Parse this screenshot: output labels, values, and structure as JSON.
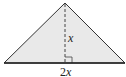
{
  "figure": {
    "shape": "isosceles triangle",
    "fill_color": "#e9e9e9",
    "stroke_color": "#333333",
    "labels": {
      "height": "x",
      "base_coef": "2",
      "base_var": "x"
    },
    "features": [
      "dashed altitude",
      "right-angle marker"
    ]
  }
}
